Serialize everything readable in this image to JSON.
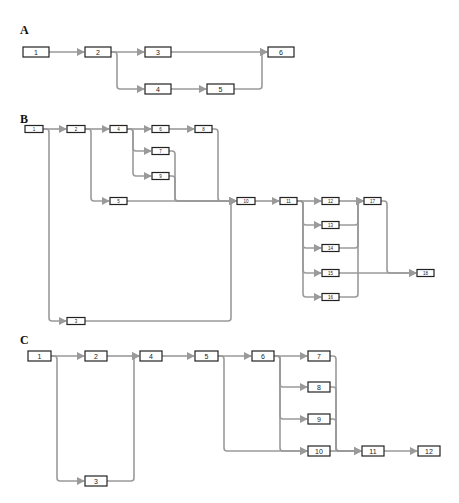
{
  "panels": [
    {
      "label": "A",
      "label_pos": [
        20,
        34
      ],
      "box_h": 10,
      "text_class": "txt",
      "nodes": [
        {
          "id": "1",
          "x": 23,
          "y": 52,
          "w": 26
        },
        {
          "id": "2",
          "x": 85,
          "y": 52,
          "w": 26
        },
        {
          "id": "3",
          "x": 145,
          "y": 52,
          "w": 26
        },
        {
          "id": "4",
          "x": 145,
          "y": 89,
          "w": 26
        },
        {
          "id": "5",
          "x": 207,
          "y": 89,
          "w": 27
        },
        {
          "id": "6",
          "x": 268,
          "y": 52,
          "w": 26
        }
      ],
      "edges": [
        [
          "1",
          "2"
        ],
        [
          "2",
          "3"
        ],
        [
          "2",
          "4"
        ],
        [
          "4",
          "5"
        ],
        [
          "3",
          "6"
        ],
        [
          "5",
          "6"
        ]
      ]
    },
    {
      "label": "B",
      "label_pos": [
        20,
        123
      ],
      "box_h": 7,
      "text_class": "txtS",
      "nodes": [
        {
          "id": "1",
          "x": 25,
          "y": 129,
          "w": 18
        },
        {
          "id": "2",
          "x": 67,
          "y": 129,
          "w": 18
        },
        {
          "id": "3",
          "x": 67,
          "y": 321,
          "w": 18
        },
        {
          "id": "4",
          "x": 110,
          "y": 129,
          "w": 17
        },
        {
          "id": "5",
          "x": 110,
          "y": 201,
          "w": 17
        },
        {
          "id": "6",
          "x": 152,
          "y": 129,
          "w": 17
        },
        {
          "id": "7",
          "x": 152,
          "y": 151,
          "w": 17
        },
        {
          "id": "8",
          "x": 195,
          "y": 129,
          "w": 17
        },
        {
          "id": "9",
          "x": 152,
          "y": 176,
          "w": 17
        },
        {
          "id": "10",
          "x": 237,
          "y": 201,
          "w": 18
        },
        {
          "id": "11",
          "x": 280,
          "y": 201,
          "w": 17
        },
        {
          "id": "12",
          "x": 322,
          "y": 201,
          "w": 17
        },
        {
          "id": "13",
          "x": 322,
          "y": 225,
          "w": 17
        },
        {
          "id": "14",
          "x": 322,
          "y": 248,
          "w": 17
        },
        {
          "id": "15",
          "x": 322,
          "y": 273,
          "w": 17
        },
        {
          "id": "16",
          "x": 322,
          "y": 297,
          "w": 17
        },
        {
          "id": "17",
          "x": 364,
          "y": 201,
          "w": 17
        },
        {
          "id": "18",
          "x": 417,
          "y": 273,
          "w": 17
        }
      ],
      "edges": [
        [
          "1",
          "2"
        ],
        [
          "1",
          "3"
        ],
        [
          "2",
          "4"
        ],
        [
          "2",
          "5"
        ],
        [
          "4",
          "6"
        ],
        [
          "4",
          "7"
        ],
        [
          "4",
          "9"
        ],
        [
          "6",
          "8"
        ],
        [
          "8",
          "10"
        ],
        [
          "7",
          "10"
        ],
        [
          "9",
          "10"
        ],
        [
          "5",
          "10"
        ],
        [
          "3",
          "10"
        ],
        [
          "10",
          "11"
        ],
        [
          "11",
          "12"
        ],
        [
          "11",
          "13"
        ],
        [
          "11",
          "14"
        ],
        [
          "11",
          "15"
        ],
        [
          "11",
          "16"
        ],
        [
          "12",
          "17"
        ],
        [
          "13",
          "17"
        ],
        [
          "14",
          "17"
        ],
        [
          "15",
          "18"
        ],
        [
          "16",
          "17"
        ],
        [
          "17",
          "18"
        ]
      ]
    },
    {
      "label": "C",
      "label_pos": [
        20,
        344
      ],
      "box_h": 10,
      "text_class": "txt",
      "nodes": [
        {
          "id": "1",
          "x": 28,
          "y": 356,
          "w": 23
        },
        {
          "id": "2",
          "x": 85,
          "y": 356,
          "w": 22
        },
        {
          "id": "3",
          "x": 85,
          "y": 481,
          "w": 22
        },
        {
          "id": "4",
          "x": 140,
          "y": 356,
          "w": 22
        },
        {
          "id": "5",
          "x": 195,
          "y": 356,
          "w": 23
        },
        {
          "id": "6",
          "x": 252,
          "y": 356,
          "w": 22
        },
        {
          "id": "7",
          "x": 308,
          "y": 356,
          "w": 22
        },
        {
          "id": "8",
          "x": 308,
          "y": 387,
          "w": 22
        },
        {
          "id": "9",
          "x": 308,
          "y": 419,
          "w": 22
        },
        {
          "id": "10",
          "x": 308,
          "y": 451,
          "w": 22
        },
        {
          "id": "11",
          "x": 362,
          "y": 451,
          "w": 22
        },
        {
          "id": "12",
          "x": 418,
          "y": 451,
          "w": 22
        }
      ],
      "edges": [
        [
          "1",
          "2"
        ],
        [
          "1",
          "3"
        ],
        [
          "2",
          "4"
        ],
        [
          "3",
          "4"
        ],
        [
          "4",
          "5"
        ],
        [
          "5",
          "6"
        ],
        [
          "5",
          "10"
        ],
        [
          "6",
          "7"
        ],
        [
          "6",
          "8"
        ],
        [
          "6",
          "9"
        ],
        [
          "6",
          "10"
        ],
        [
          "7",
          "11"
        ],
        [
          "8",
          "11"
        ],
        [
          "9",
          "11"
        ],
        [
          "10",
          "11"
        ],
        [
          "11",
          "12"
        ]
      ]
    }
  ]
}
